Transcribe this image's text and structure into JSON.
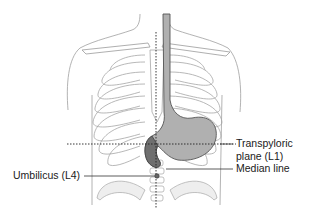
{
  "figure": {
    "colors": {
      "outline": "#9a9a9a",
      "organ_fill": "#8c8c8c",
      "organ_light": "#b8b8b8",
      "leader_line": "#333333",
      "dotted_line": "#222222",
      "text": "#1a1a1a"
    }
  },
  "labels": {
    "transpyloric_line1": "Transpyloric",
    "transpyloric_line2": "plane (L1)",
    "median_line": "Median line",
    "umbilicus": "Umbilicus (L4)"
  }
}
